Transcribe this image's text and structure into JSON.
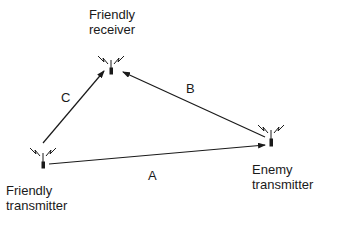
{
  "nodes": {
    "friendly_receiver": {
      "line1": "Friendly",
      "line2": "receiver"
    },
    "friendly_transmitter": {
      "line1": "Friendly",
      "line2": "transmitter"
    },
    "enemy_transmitter": {
      "line1": "Enemy",
      "line2": "transmitter"
    }
  },
  "edges": {
    "a": {
      "label": "A",
      "from": "friendly_transmitter",
      "to": "enemy_transmitter"
    },
    "b": {
      "label": "B",
      "from": "enemy_transmitter",
      "to": "friendly_receiver"
    },
    "c": {
      "label": "C",
      "from": "friendly_transmitter",
      "to": "friendly_receiver"
    }
  },
  "colors": {
    "ink": "#1a1a1a",
    "background": "#ffffff"
  }
}
